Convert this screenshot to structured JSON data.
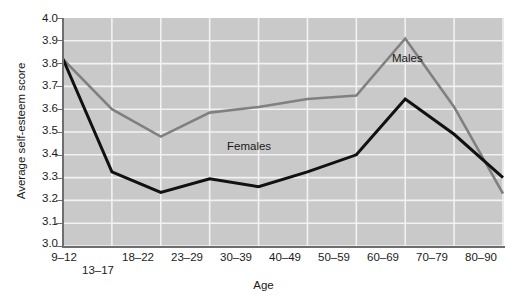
{
  "chart_data": {
    "type": "line",
    "title": "",
    "xlabel": "Age",
    "ylabel": "Average self-esteem score",
    "categories": [
      "9–12",
      "13–17",
      "18–22",
      "23–29",
      "30–39",
      "40–49",
      "50–59",
      "60–69",
      "70–79",
      "80–90"
    ],
    "ylim": [
      3.0,
      4.0
    ],
    "ytick_labels": [
      "4.0",
      "3.9",
      "3.8",
      "3.7",
      "3.6",
      "3.5",
      "3.4",
      "3.3",
      "3.2",
      "3.1",
      "3.0"
    ],
    "ytick_values": [
      4.0,
      3.9,
      3.8,
      3.7,
      3.6,
      3.5,
      3.4,
      3.3,
      3.2,
      3.1,
      3.0
    ],
    "grid": true,
    "legend_position": "inline-annotations",
    "series": [
      {
        "name": "Males",
        "color": "#808080",
        "values": [
          3.82,
          3.6,
          3.48,
          3.585,
          3.61,
          3.645,
          3.66,
          3.91,
          3.61,
          3.23
        ]
      },
      {
        "name": "Females",
        "color": "#111111",
        "values": [
          3.82,
          3.325,
          3.235,
          3.295,
          3.26,
          3.325,
          3.4,
          3.645,
          3.49,
          3.3
        ]
      }
    ],
    "annotations": [
      {
        "text": "Males",
        "x_category": "70–79",
        "y_value": 3.8
      },
      {
        "text": "Females",
        "x_category": "40–49",
        "y_value": 3.41
      }
    ]
  },
  "axis": {
    "y_title": "Average self-esteem score",
    "x_title": "Age"
  },
  "colors": {
    "plot_background": "#c9c9c9",
    "gridline": "#f2f2f2",
    "axis": "#6e6e6e",
    "males_line": "#808080",
    "females_line": "#111111",
    "text": "#1a1a1a"
  }
}
